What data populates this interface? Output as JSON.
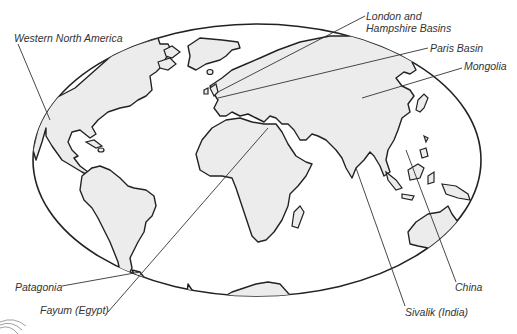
{
  "map": {
    "projection": "oval world map",
    "colors": {
      "land": "#ececec",
      "outline": "#222222",
      "ocean": "#ffffff",
      "label_text": "#333333"
    },
    "labels": [
      {
        "id": "western-north-america",
        "text": "Western North America"
      },
      {
        "id": "london-hampshire",
        "text": "London and",
        "text2": "Hampshire Basins"
      },
      {
        "id": "paris-basin",
        "text": "Paris Basin"
      },
      {
        "id": "mongolia",
        "text": "Mongolia"
      },
      {
        "id": "patagonia",
        "text": "Patagonia"
      },
      {
        "id": "fayum",
        "text": "Fayum (Egypt)"
      },
      {
        "id": "sivalik",
        "text": "Sivalik (India)"
      },
      {
        "id": "china",
        "text": "China"
      }
    ]
  }
}
